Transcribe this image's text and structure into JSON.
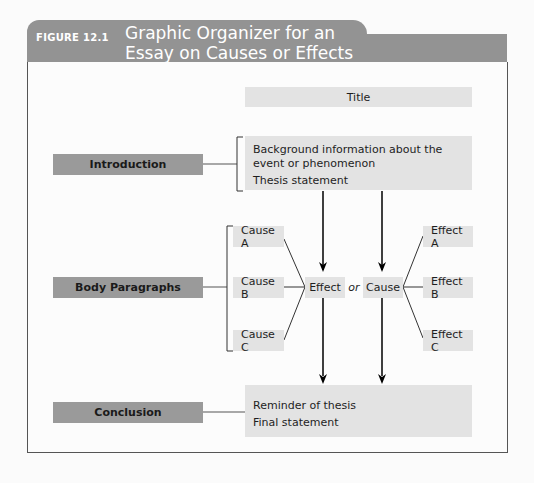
{
  "figure": {
    "label": "FIGURE 12.1",
    "title": "Graphic Organizer for an Essay on Causes or Effects"
  },
  "colors": {
    "header": "#939393",
    "label_box": "#9a9a9a",
    "content_box": "#e3e3e3"
  },
  "title_box": "Title",
  "sections": {
    "introduction": {
      "label": "Introduction",
      "lines": [
        "Background information about the event or phenomenon",
        "Thesis statement"
      ]
    },
    "body": {
      "label": "Body Paragraphs",
      "causes": [
        "Cause A",
        "Cause B",
        "Cause C"
      ],
      "effect": "Effect",
      "connector": "or",
      "cause": "Cause",
      "effects": [
        "Effect A",
        "Effect B",
        "Effect C"
      ]
    },
    "conclusion": {
      "label": "Conclusion",
      "lines": [
        "Reminder of thesis",
        "Final statement"
      ]
    }
  }
}
